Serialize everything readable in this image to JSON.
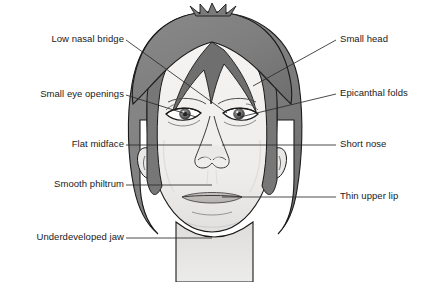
{
  "figure": {
    "colors": {
      "hair": "#7e7e7e",
      "hair_shadow": "#6a6a6a",
      "skin": "#f2f0ee",
      "skin_shade": "#dedcda",
      "outline": "#1a1a1a",
      "leader_line": "#2a2a2a",
      "text": "#1a1a1a",
      "background": "#ffffff"
    }
  },
  "labels": {
    "left": [
      {
        "id": "low-nasal-bridge",
        "text": "Low nasal bridge",
        "text_x": 30,
        "text_y": 33,
        "text_width": 94,
        "leader": [
          [
            126,
            40
          ],
          [
            227,
            113
          ]
        ]
      },
      {
        "id": "small-eye-openings",
        "text": "Small eye openings",
        "text_x": 22,
        "text_y": 88,
        "text_width": 102,
        "leader": [
          [
            126,
            95
          ],
          [
            196,
            117
          ]
        ]
      },
      {
        "id": "flat-midface",
        "text": "Flat midface",
        "text_x": 48,
        "text_y": 138,
        "text_width": 76,
        "leader": [
          [
            126,
            145
          ],
          [
            212,
            145
          ]
        ]
      },
      {
        "id": "smooth-philtrum",
        "text": "Smooth philtrum",
        "text_x": 32,
        "text_y": 178,
        "text_width": 92,
        "leader": [
          [
            126,
            185
          ],
          [
            212,
            185
          ]
        ]
      },
      {
        "id": "underdeveloped-jaw",
        "text": "Underdeveloped jaw",
        "text_x": 18,
        "text_y": 231,
        "text_width": 106,
        "leader": [
          [
            126,
            238
          ],
          [
            212,
            238
          ]
        ]
      }
    ],
    "right": [
      {
        "id": "small-head",
        "text": "Small head",
        "text_x": 340,
        "text_y": 33,
        "leader": [
          [
            336,
            40
          ],
          [
            253,
            86
          ]
        ]
      },
      {
        "id": "epicanthal-folds",
        "text": "Epicanthal folds",
        "text_x": 340,
        "text_y": 87,
        "leader": [
          [
            336,
            94
          ],
          [
            240,
            117
          ]
        ]
      },
      {
        "id": "short-nose",
        "text": "Short nose",
        "text_x": 340,
        "text_y": 138,
        "leader": [
          [
            336,
            145
          ],
          [
            222,
            145
          ]
        ]
      },
      {
        "id": "thin-upper-lip",
        "text": "Thin upper lip",
        "text_x": 340,
        "text_y": 190,
        "leader": [
          [
            336,
            197
          ],
          [
            222,
            197
          ]
        ]
      }
    ]
  }
}
